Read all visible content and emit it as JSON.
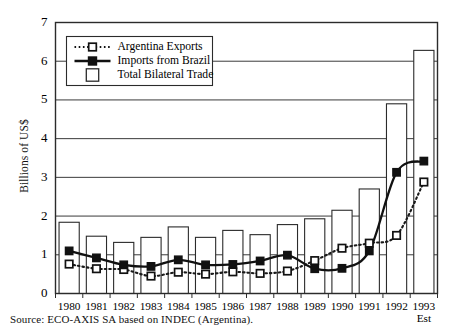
{
  "figure": {
    "ylabel": "Billions of US$",
    "source": "Source: ECO-AXIS SA based on INDEC (Argentina).",
    "est_note": "Est"
  },
  "legend": {
    "items": [
      {
        "label": "Argentina Exports",
        "marker": "open-square",
        "line": "dotted"
      },
      {
        "label": "Imports from Brazil",
        "marker": "filled-square",
        "line": "solid"
      },
      {
        "label": "Total Bilateral Trade",
        "marker": "open-square-bar",
        "line": "none"
      }
    ]
  },
  "chart_data": {
    "type": "bar",
    "title": "",
    "xlabel": "",
    "ylabel": "Billions of US$",
    "ylim": [
      0,
      7
    ],
    "yticks": [
      0,
      1,
      2,
      3,
      4,
      5,
      6,
      7
    ],
    "grid": true,
    "legend_position": "top-left",
    "categories": [
      "1980",
      "1981",
      "1982",
      "1983",
      "1984",
      "1985",
      "1986",
      "1987",
      "1988",
      "1989",
      "1990",
      "1991",
      "1992",
      "1993"
    ],
    "series": [
      {
        "name": "Total Bilateral Trade",
        "type": "bar",
        "values": [
          1.84,
          1.48,
          1.32,
          1.45,
          1.72,
          1.45,
          1.63,
          1.52,
          1.78,
          1.93,
          2.15,
          2.7,
          4.9,
          6.28
        ]
      },
      {
        "name": "Imports from Brazil",
        "type": "line",
        "values": [
          1.1,
          0.92,
          0.74,
          0.7,
          0.87,
          0.74,
          0.75,
          0.84,
          0.99,
          0.64,
          0.65,
          1.1,
          3.13,
          3.42
        ]
      },
      {
        "name": "Argentina Exports",
        "type": "line",
        "values": [
          0.76,
          0.64,
          0.62,
          0.45,
          0.55,
          0.5,
          0.56,
          0.52,
          0.58,
          0.85,
          1.17,
          1.3,
          1.5,
          2.88
        ]
      }
    ],
    "annotations": [
      {
        "x": "1993",
        "text": "Est",
        "position": "below-axis"
      }
    ]
  }
}
